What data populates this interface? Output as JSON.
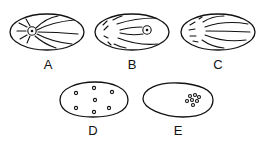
{
  "figure": {
    "stroke_color": "#111111",
    "background": "#ffffff",
    "panels": [
      {
        "id": "A",
        "label": "A",
        "shape": "oval",
        "feature": "centrosome at left with radiating astral fibers and spindle fibers"
      },
      {
        "id": "B",
        "label": "B",
        "shape": "oval",
        "feature": "centrosome at right with fibers converging from left"
      },
      {
        "id": "C",
        "label": "C",
        "shape": "oval",
        "feature": "fibers radiating from left, no centrosome"
      },
      {
        "id": "D",
        "label": "D",
        "shape": "oval",
        "feature": "seven small dots scattered throughout"
      },
      {
        "id": "E",
        "label": "E",
        "shape": "egg",
        "feature": "cluster of small dots at right"
      }
    ]
  }
}
